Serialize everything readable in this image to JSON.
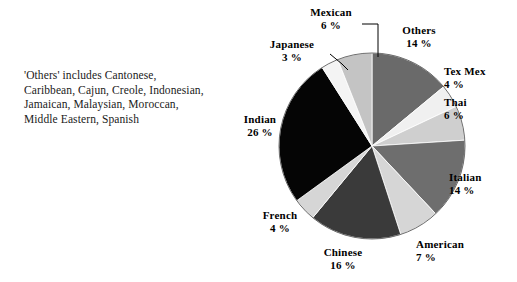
{
  "caption": {
    "lines": [
      "'Others' includes Cantonese,",
      "Caribbean, Cajun, Creole, Indonesian,",
      "Jamaican, Malaysian, Moroccan,",
      "Middle Eastern, Spanish"
    ]
  },
  "labels": {
    "mexican": {
      "name": "Mexican",
      "pct": "6 %"
    },
    "others": {
      "name": "Others",
      "pct": "14 %"
    },
    "japanese": {
      "name": "Japanese",
      "pct": "3 %"
    },
    "texmex": {
      "name": "Tex Mex",
      "pct": "4 %"
    },
    "thai": {
      "name": "Thai",
      "pct": "6 %"
    },
    "italian": {
      "name": "Italian",
      "pct": "14 %"
    },
    "american": {
      "name": "American",
      "pct": "7 %"
    },
    "chinese": {
      "name": "Chinese",
      "pct": "16 %"
    },
    "french": {
      "name": "French",
      "pct": "4 %"
    },
    "indian": {
      "name": "Indian",
      "pct": "26 %"
    }
  },
  "chart_data": {
    "type": "pie",
    "title": "",
    "xlabel": "",
    "ylabel": "",
    "legend": "none",
    "grid": false,
    "start_angle_deg": 0,
    "direction": "clockwise",
    "center": {
      "x": 372,
      "y": 146
    },
    "radius": 93,
    "categories": [
      "Others",
      "Tex Mex",
      "Thai",
      "Italian",
      "American",
      "Chinese",
      "French",
      "Indian",
      "Japanese",
      "Mexican"
    ],
    "values": [
      14,
      4,
      6,
      14,
      7,
      16,
      4,
      26,
      3,
      6
    ],
    "unit": "percent",
    "total": 100,
    "slices": [
      {
        "label": "Others",
        "value": 14,
        "pct_text": "14 %",
        "color": "#6a6a6a"
      },
      {
        "label": "Tex Mex",
        "value": 4,
        "pct_text": "4 %",
        "color": "#f0f0f0"
      },
      {
        "label": "Thai",
        "value": 6,
        "pct_text": "6 %",
        "color": "#cfcfcf"
      },
      {
        "label": "Italian",
        "value": 14,
        "pct_text": "14 %",
        "color": "#6e6e6e"
      },
      {
        "label": "American",
        "value": 7,
        "pct_text": "7 %",
        "color": "#d6d6d6"
      },
      {
        "label": "Chinese",
        "value": 16,
        "pct_text": "16 %",
        "color": "#3a3a3a"
      },
      {
        "label": "French",
        "value": 4,
        "pct_text": "4 %",
        "color": "#d6d6d6"
      },
      {
        "label": "Indian",
        "value": 26,
        "pct_text": "26 %",
        "color": "#050505"
      },
      {
        "label": "Japanese",
        "value": 3,
        "pct_text": "3 %",
        "color": "#f4f4f4"
      },
      {
        "label": "Mexican",
        "value": 6,
        "pct_text": "6 %",
        "color": "#c4c4c4"
      }
    ],
    "leader_lines": [
      "Mexican",
      "Japanese"
    ]
  }
}
